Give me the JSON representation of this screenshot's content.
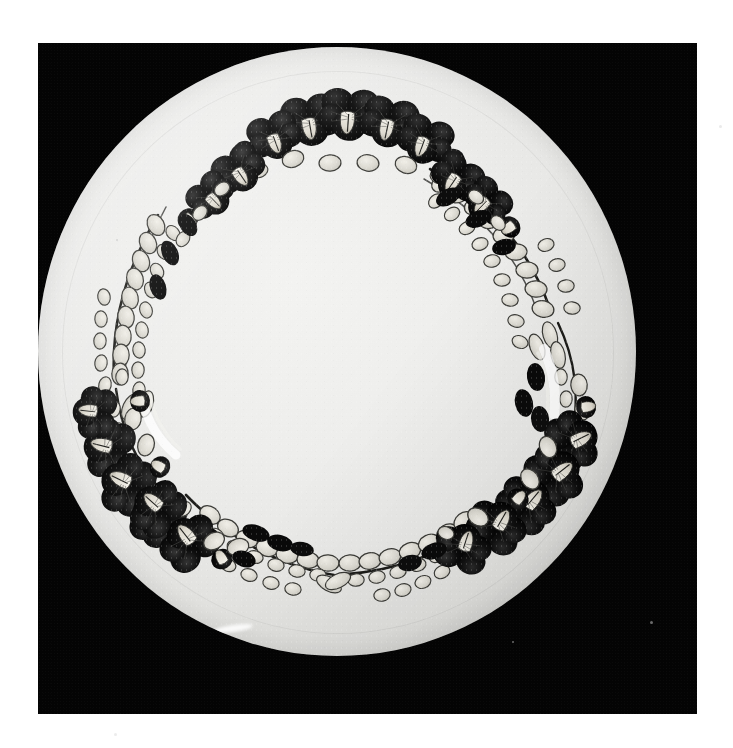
{
  "document": {
    "medium": "black-and-white photograph",
    "page_background_color": "#ffffff",
    "caption": ""
  },
  "photo": {
    "background_color": "#040404",
    "left": 38,
    "top": 43,
    "width": 659,
    "height": 671,
    "tone": "high-contrast monochrome",
    "specks": [
      {
        "x": 612,
        "y": 578,
        "size": 3
      },
      {
        "x": 474,
        "y": 598,
        "size": 2
      },
      {
        "x": 78,
        "y": 196,
        "size": 2
      }
    ]
  },
  "subject": {
    "object_name": "decorated porcelain plate",
    "shape": "circular",
    "center_x": 299,
    "center_y": 304,
    "radius": 299,
    "body_color": "#eeeeec",
    "rim_shadow_color": "#a9a9a5",
    "surface_texture": "fine ceramic grain"
  },
  "decoration": {
    "motif": "floral wreath border",
    "description": "ring of dark pansy flower clusters joined by pale leaf garlands",
    "flower_color": "#0b0b0b",
    "flower_highlight_color": "#e8e6df",
    "leaf_fill_color": "#dedcd4",
    "leaf_outline_color": "#2a2a28",
    "stem_color": "#1a1a18",
    "wreath_center_x": 299,
    "wreath_center_y": 300,
    "wreath_radius": 212,
    "clusters": [
      {
        "name": "top-center-cluster",
        "angle_deg": -90,
        "flower_count": 7
      },
      {
        "name": "right-cluster",
        "angle_deg": 10,
        "flower_count": 8
      },
      {
        "name": "bottom-right-cluster",
        "angle_deg": 52,
        "flower_count": 7
      },
      {
        "name": "bottom-left-cluster",
        "angle_deg": 128,
        "flower_count": 9
      },
      {
        "name": "left-cluster",
        "angle_deg": 170,
        "flower_count": 6
      }
    ],
    "garlands": [
      {
        "name": "upper-left-garland",
        "start_angle_deg": 185,
        "end_angle_deg": 255
      },
      {
        "name": "upper-right-garland",
        "start_angle_deg": -70,
        "end_angle_deg": -5
      },
      {
        "name": "lower-garland-left",
        "start_angle_deg": 95,
        "end_angle_deg": 125
      },
      {
        "name": "lower-garland-right",
        "start_angle_deg": 55,
        "end_angle_deg": 92
      }
    ]
  }
}
